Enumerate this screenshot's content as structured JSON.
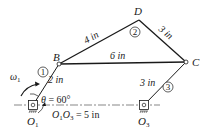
{
  "diagram": {
    "type": "four-bar linkage with coupler triangle",
    "points": {
      "B": "B",
      "C": "C",
      "D": "D",
      "O1": "O",
      "O1_sub": "1",
      "O3": "O",
      "O3_sub": "3"
    },
    "links": [
      {
        "id": "1",
        "label": "①",
        "number": "1",
        "length": "2 in"
      },
      {
        "id": "2",
        "label": "②",
        "number": "2"
      },
      {
        "id": "3",
        "label": "③",
        "number": "3",
        "length": "3 in"
      }
    ],
    "dimensions": {
      "BD": "4 in",
      "DC": "3 in",
      "BC": "6 in",
      "O1B": "2 in",
      "O3C": "3 in"
    },
    "angle": {
      "symbol": "θ",
      "text": " = 60°"
    },
    "ground": {
      "text_prefix": "O",
      "sub1": "1",
      "mid": "O",
      "sub2": "3",
      "text_suffix": " = 5 in"
    },
    "omega": {
      "symbol": "ω",
      "sub": "1"
    },
    "colors": {
      "line": "#1a1a1a",
      "background": "#ffffff"
    }
  }
}
